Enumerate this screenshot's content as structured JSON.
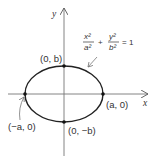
{
  "diagram": {
    "type": "ellipse",
    "axes": {
      "x_label": "x",
      "y_label": "y"
    },
    "equation": {
      "num1": "x²",
      "den1": "a²",
      "plus": "+",
      "num2": "y²",
      "den2": "b²",
      "rhs": "= 1"
    },
    "points": [
      {
        "label": "(0, b)",
        "role": "top-vertex"
      },
      {
        "label": "(a, 0)",
        "role": "right-vertex"
      },
      {
        "label": "(−a, 0)",
        "role": "left-vertex"
      },
      {
        "label": "(0, −b)",
        "role": "bottom-vertex"
      }
    ],
    "colors": {
      "stroke": "#333333",
      "background": "#ffffff"
    }
  }
}
